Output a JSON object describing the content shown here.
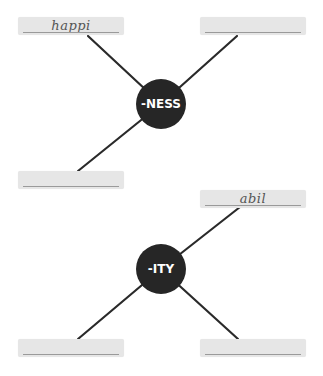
{
  "diagrams": [
    {
      "suffix": "-NESS",
      "boxes": [
        {
          "position": "top-left",
          "text": "happi"
        },
        {
          "position": "top-right",
          "text": ""
        },
        {
          "position": "bottom-left",
          "text": ""
        }
      ]
    },
    {
      "suffix": "-ITY",
      "boxes": [
        {
          "position": "top-right",
          "text": "abil"
        },
        {
          "position": "bottom-left",
          "text": ""
        },
        {
          "position": "bottom-right",
          "text": ""
        }
      ]
    }
  ],
  "colors": {
    "hub": "#262626",
    "box": "#e6e6e6",
    "line": "#2a2a2a"
  }
}
